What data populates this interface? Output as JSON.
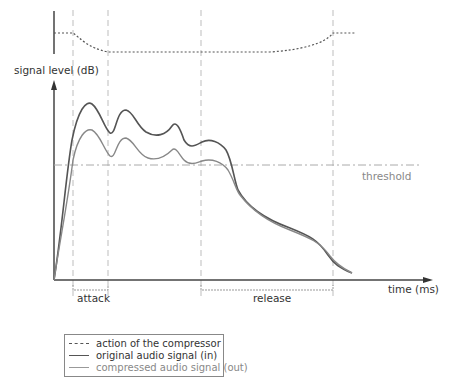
{
  "diagram": {
    "y_axis_label": "signal level (dB)",
    "x_axis_label": "time (ms)",
    "threshold_label": "threshold",
    "phases": [
      {
        "label": "attack",
        "start_x": 73,
        "end_x": 108
      },
      {
        "label": "release",
        "start_x": 201,
        "end_x": 333
      }
    ],
    "colors": {
      "axis": "#444444",
      "original_signal": "#555555",
      "compressed_signal": "#888888",
      "compressor_action": "#555555",
      "guides": "#bbbbbb",
      "threshold": "#aaaaaa"
    }
  },
  "legend": {
    "items": [
      {
        "style": "dotted",
        "label": "action of the compressor"
      },
      {
        "style": "solid-dark",
        "label": "original audio signal (in)"
      },
      {
        "style": "solid-light",
        "label": "compressed audio signal (out)"
      }
    ]
  }
}
